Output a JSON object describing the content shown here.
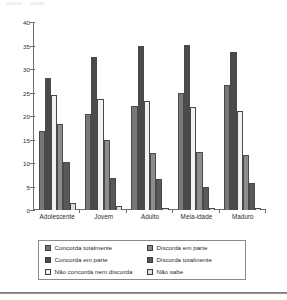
{
  "chart_data": {
    "type": "bar",
    "title": "",
    "subtitle": "",
    "xlabel": "",
    "ylabel": "",
    "ylim": [
      0,
      40
    ],
    "yticks": [
      0,
      5,
      10,
      15,
      20,
      25,
      30,
      35,
      40
    ],
    "grid": false,
    "legend_position": "bottom",
    "categories": [
      "Adolescente",
      "Jovem",
      "Adulto",
      "Meia-idade",
      "Maduro"
    ],
    "series": [
      {
        "name": "Concorda totalmente",
        "color": "#787878",
        "values": [
          16.8,
          20.5,
          22.2,
          24.8,
          26.5
        ]
      },
      {
        "name": "Concorda em parte",
        "color": "#4a4a4a",
        "values": [
          28.1,
          32.6,
          34.8,
          35.1,
          33.7
        ]
      },
      {
        "name": "Não concorda nem discorda",
        "color": "#f2f2f2",
        "values": [
          24.4,
          23.7,
          23.1,
          21.9,
          21.0
        ]
      },
      {
        "name": "Discorda em parte",
        "color": "#8c8c8c",
        "values": [
          18.4,
          14.8,
          12.1,
          12.3,
          11.7
        ]
      },
      {
        "name": "Discorda totalmente",
        "color": "#595959",
        "values": [
          10.2,
          6.9,
          6.6,
          5.0,
          5.7
        ]
      },
      {
        "name": "Não sabe",
        "color": "#dcdcdc",
        "values": [
          1.4,
          0.9,
          0.5,
          0.4,
          0.5
        ]
      }
    ]
  },
  "axis": {
    "y_tick_labels": [
      "40",
      "35",
      "30",
      "25",
      "20",
      "15",
      "10",
      "5",
      "0"
    ]
  },
  "legend": {
    "left_column": [
      "Concorda totalmente",
      "Concorda em parte",
      "Não concorda nem discorda"
    ],
    "right_column": [
      "Discorda em parte",
      "Discorda totalmente",
      "Não sabe"
    ]
  }
}
